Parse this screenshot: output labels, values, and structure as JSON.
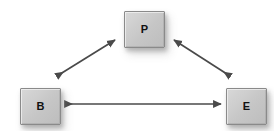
{
  "diagram": {
    "type": "triangular-relationship-diagram",
    "width": 274,
    "height": 131,
    "background_color": "#ffffff",
    "node_fill_color": "#cccccc",
    "node_border_color": "#8a8a8a",
    "arrow_color": "#4a4a4a",
    "label_color": "#111111",
    "nodes": [
      {
        "id": "p",
        "label": "P",
        "position": "top-center",
        "x": 124,
        "y": 11,
        "width": 41,
        "height": 37
      },
      {
        "id": "b",
        "label": "B",
        "position": "bottom-left",
        "x": 20,
        "y": 88,
        "width": 41,
        "height": 37
      },
      {
        "id": "e",
        "label": "E",
        "position": "bottom-right",
        "x": 226,
        "y": 88,
        "width": 41,
        "height": 37
      }
    ],
    "connectors": [
      {
        "id": "b-p",
        "from": "b",
        "to": "p",
        "style": "double-headed-arrow",
        "orientation": "diagonal-up-right",
        "x1": 57,
        "y1": 76,
        "x2": 115,
        "y2": 40
      },
      {
        "id": "p-e",
        "from": "p",
        "to": "e",
        "style": "double-headed-arrow",
        "orientation": "diagonal-down-right",
        "x1": 174,
        "y1": 40,
        "x2": 230,
        "y2": 76
      },
      {
        "id": "b-e",
        "from": "b",
        "to": "e",
        "style": "double-headed-arrow",
        "orientation": "horizontal",
        "x1": 65,
        "y1": 104,
        "x2": 221,
        "y2": 104
      }
    ]
  }
}
